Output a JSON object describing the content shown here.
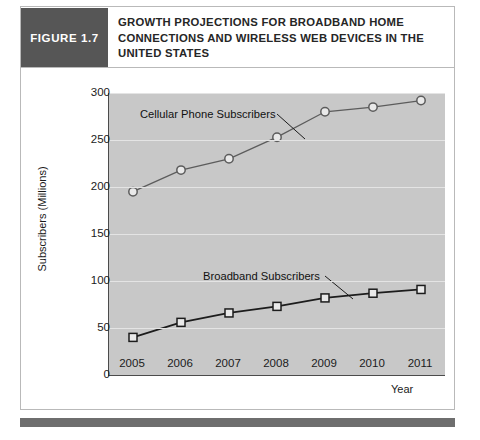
{
  "figure": {
    "tag": "FIGURE 1.7",
    "title": "GROWTH PROJECTIONS FOR BROADBAND HOME CONNECTIONS AND WIRELESS WEB DEVICES IN THE UNITED STATES"
  },
  "chart_data": {
    "type": "line",
    "title": "",
    "xlabel": "Year",
    "ylabel": "Subscribers (Millions)",
    "categories": [
      "2005",
      "2006",
      "2007",
      "2008",
      "2009",
      "2010",
      "2011"
    ],
    "x": [
      2005,
      2006,
      2007,
      2008,
      2009,
      2010,
      2011
    ],
    "ylim": [
      0,
      300
    ],
    "yticks": [
      "0",
      "50",
      "100",
      "150",
      "200",
      "250",
      "300"
    ],
    "ytick_values": [
      0,
      50,
      100,
      150,
      200,
      250,
      300
    ],
    "grid": true,
    "legend_position": "inline-annotation",
    "series": [
      {
        "name": "Cellular Phone Subscribers",
        "marker": "open-circle",
        "color": "#5c5c5c",
        "values": [
          195,
          218,
          230,
          253,
          280,
          285,
          292
        ]
      },
      {
        "name": "Broadband Subscribers",
        "marker": "open-square",
        "color": "#1c1c1c",
        "values": [
          40,
          56,
          66,
          73,
          82,
          87,
          91
        ]
      }
    ],
    "annotations": [
      {
        "text": "Cellular Phone Subscribers",
        "series": "Cellular Phone Subscribers"
      },
      {
        "text": "Broadband Subscribers",
        "series": "Broadband Subscribers"
      }
    ]
  },
  "colors": {
    "tag_background": "#565656",
    "plot_background": "#c8c8c8",
    "gridline": "#e4e4e4",
    "axis": "#4b4b4b",
    "footer_bar": "#6e6e6e"
  }
}
